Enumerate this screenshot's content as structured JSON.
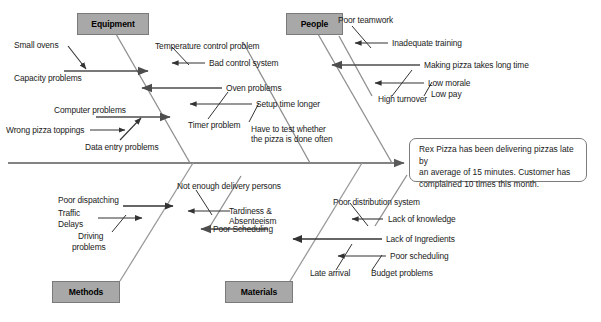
{
  "diagram": {
    "type": "fishbone-ishikawa",
    "spine_arrow_color": "#595959",
    "category_box_fill": "#a8a8a8",
    "bone_color": "#4d4d4d",
    "sub_bone_color": "#3f3f3f"
  },
  "problem_statement": {
    "line1": "Rex Pizza has been delivering pizzas late by",
    "line2": "an average of 15 minutes. Customer has",
    "line3": "complained 10 times this month."
  },
  "categories": [
    {
      "id": "equipment",
      "label": "Equipment",
      "position": "top-left"
    },
    {
      "id": "people",
      "label": "People",
      "position": "top-right"
    },
    {
      "id": "methods",
      "label": "Methods",
      "position": "bottom-left"
    },
    {
      "id": "materials",
      "label": "Materials",
      "position": "bottom-right"
    }
  ],
  "causes": {
    "equipment": [
      {
        "id": "eq-small-ovens",
        "label": "Small ovens",
        "level": "sub"
      },
      {
        "id": "eq-capacity-problems",
        "label": "Capacity problems",
        "level": "main"
      },
      {
        "id": "eq-computer-problems",
        "label": "Computer problems",
        "level": "main"
      },
      {
        "id": "eq-wrong-pizza-toppings",
        "label": "Wrong pizza toppings",
        "level": "sub"
      },
      {
        "id": "eq-data-entry-problems",
        "label": "Data entry problems",
        "level": "sub"
      },
      {
        "id": "eq-temperature-control-problem",
        "label": "Temperature control problem",
        "level": "main"
      },
      {
        "id": "eq-bad-control-system",
        "label": "Bad control system",
        "level": "sub"
      },
      {
        "id": "eq-oven-problems",
        "label": "Oven problems",
        "level": "main"
      },
      {
        "id": "eq-setup-time-longer",
        "label": "Setup time longer",
        "level": "sub"
      },
      {
        "id": "eq-timer-problem",
        "label": "Timer problem",
        "level": "main"
      },
      {
        "id": "eq-have-to-test-line1",
        "label": "Have to test whether",
        "level": "sub"
      },
      {
        "id": "eq-have-to-test-line2",
        "label": "the pizza is done often",
        "level": "sub"
      }
    ],
    "people": [
      {
        "id": "pe-poor-teamwork",
        "label": "Poor teamwork",
        "level": "main"
      },
      {
        "id": "pe-inadequate-training",
        "label": "Inadequate training",
        "level": "sub"
      },
      {
        "id": "pe-making-pizza-takes-long-time",
        "label": "Making pizza takes long time",
        "level": "main"
      },
      {
        "id": "pe-low-morale",
        "label": "Low morale",
        "level": "sub"
      },
      {
        "id": "pe-high-turnover",
        "label": "High turnover",
        "level": "main"
      },
      {
        "id": "pe-low-pay",
        "label": "Low pay",
        "level": "sub"
      }
    ],
    "methods": [
      {
        "id": "me-poor-dispatching",
        "label": "Poor dispatching",
        "level": "main"
      },
      {
        "id": "me-traffic",
        "label": "Traffic",
        "level": "sub"
      },
      {
        "id": "me-delays",
        "label": "Delays",
        "level": "sub"
      },
      {
        "id": "me-driving-problems-line1",
        "label": "Driving",
        "level": "sub"
      },
      {
        "id": "me-driving-problems-line2",
        "label": "problems",
        "level": "sub"
      },
      {
        "id": "me-not-enough-delivery-persons",
        "label": "Not enough delivery persons",
        "level": "main"
      },
      {
        "id": "me-tardiness-line1",
        "label": "Tardiness &",
        "level": "sub"
      },
      {
        "id": "me-tardiness-line2",
        "label": "Absenteeism",
        "level": "sub"
      },
      {
        "id": "me-poor-scheduling",
        "label": "Poor Scheduling",
        "level": "main"
      }
    ],
    "materials": [
      {
        "id": "ma-poor-distribution-system",
        "label": "Poor distribution system",
        "level": "main"
      },
      {
        "id": "ma-lack-of-knowledge",
        "label": "Lack of knowledge",
        "level": "sub"
      },
      {
        "id": "ma-lack-of-ingredients",
        "label": "Lack of Ingredients",
        "level": "main"
      },
      {
        "id": "ma-poor-scheduling",
        "label": "Poor scheduling",
        "level": "sub"
      },
      {
        "id": "ma-late-arrival",
        "label": "Late arrival",
        "level": "main"
      },
      {
        "id": "ma-budget-problems",
        "label": "Budget problems",
        "level": "sub"
      }
    ]
  }
}
